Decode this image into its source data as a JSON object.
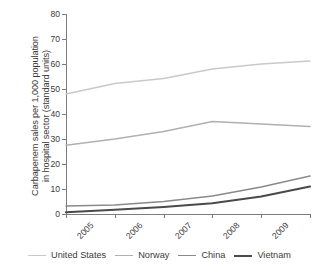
{
  "chart_data": {
    "type": "line",
    "title": "",
    "subtitle": "",
    "xlabel": "",
    "ylabel": "Carbapenem sales per 1,000 population in hospital sector (standard units)",
    "ylabel_line1": "Carbapenem sales per 1,000 population",
    "ylabel_line2": "in hospital sector (standard units)",
    "x": [
      "2005",
      "2006",
      "2007",
      "2008",
      "2009",
      "2010"
    ],
    "categories": [
      "2005",
      "2006",
      "2007",
      "2008",
      "2009",
      "2010"
    ],
    "xtick_labels": [
      "2005",
      "2006",
      "2007",
      "2008",
      "2009",
      "2010"
    ],
    "ytick_labels": [
      "0",
      "10",
      "20",
      "30",
      "40",
      "50",
      "60",
      "70",
      "80"
    ],
    "yticks": [
      0,
      10,
      20,
      30,
      40,
      50,
      60,
      70,
      80
    ],
    "ylim": [
      0,
      80
    ],
    "xlim": [
      "2005",
      "2010"
    ],
    "grid": false,
    "legend_position": "bottom",
    "series": [
      {
        "name": "United States",
        "values": [
          48.0,
          52.2,
          54.2,
          58.0,
          60.0,
          61.2
        ],
        "color": "#c9c9c9",
        "line_width": 1.5
      },
      {
        "name": "Norway",
        "values": [
          27.5,
          30.0,
          33.0,
          37.0,
          36.0,
          35.0
        ],
        "color": "#b0b0b0",
        "line_width": 1.5
      },
      {
        "name": "China",
        "values": [
          3.2,
          3.6,
          5.0,
          7.2,
          10.8,
          15.2
        ],
        "color": "#8a8a8a",
        "line_width": 1.6
      },
      {
        "name": "Vietnam",
        "values": [
          0.7,
          1.7,
          2.8,
          4.3,
          7.0,
          11.0
        ],
        "color": "#4a4a4a",
        "line_width": 2.2
      }
    ]
  },
  "legend": {
    "items": [
      {
        "label": "United States",
        "color": "#c9c9c9",
        "thickness": "1.6px"
      },
      {
        "label": "Norway",
        "color": "#b0b0b0",
        "thickness": "1.6px"
      },
      {
        "label": "China",
        "color": "#8a8a8a",
        "thickness": "1.8px"
      },
      {
        "label": "Vietnam",
        "color": "#4a4a4a",
        "thickness": "2.6px"
      }
    ]
  },
  "axis": {
    "line_color": "#7d7d7d"
  }
}
